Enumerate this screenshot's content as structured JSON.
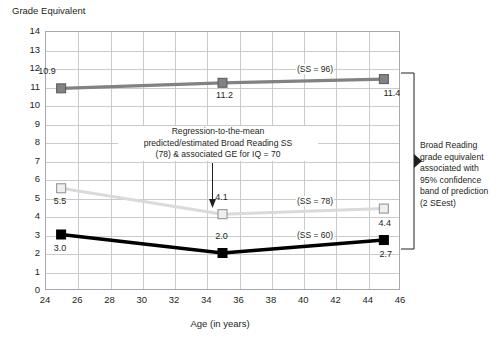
{
  "chart_data": {
    "type": "line",
    "title": "",
    "ylabel": "Grade Equivalent",
    "xlabel": "Age (in years)",
    "xlim": [
      24,
      46
    ],
    "ylim": [
      0,
      14
    ],
    "xticks": [
      24,
      26,
      28,
      30,
      32,
      34,
      36,
      38,
      40,
      42,
      44,
      46
    ],
    "yticks": [
      0,
      1,
      2,
      3,
      4,
      5,
      6,
      7,
      8,
      9,
      10,
      11,
      12,
      13,
      14
    ],
    "grid": true,
    "legend": "inline-line-labels",
    "x": [
      25,
      35,
      45
    ],
    "series": [
      {
        "name": "(SS = 96)",
        "color": "#808285",
        "marker": "filled-square",
        "values": [
          10.9,
          11.2,
          11.4
        ],
        "labels": [
          "10.9",
          "11.2",
          "11.4"
        ]
      },
      {
        "name": "(SS = 78)",
        "color": "#d9dadb",
        "marker": "open-square",
        "values": [
          5.5,
          4.1,
          4.4
        ],
        "labels": [
          "5.5",
          "4.1",
          "4.4"
        ]
      },
      {
        "name": "(SS = 60)",
        "color": "#000000",
        "marker": "filled-square",
        "values": [
          3.0,
          2.0,
          2.7
        ],
        "labels": [
          "3.0",
          "2.0",
          "2.7"
        ]
      }
    ],
    "annotations": [
      {
        "id": "center",
        "line1": "Regression-to-the-mean",
        "line2": "predicted/estimated Broad Reading SS",
        "line3": "(78) & associated GE for IQ = 70"
      },
      {
        "id": "right",
        "line1": "Broad Reading",
        "line2": "grade equivalent",
        "line3": "associated with",
        "line4": "95% confidence",
        "line5": "band of prediction",
        "line6": "(2 SEest)"
      }
    ]
  },
  "axis": {
    "y_title": "Grade Equivalent",
    "x_title": "Age (in years)"
  },
  "series_labels": {
    "ss96": "(SS = 96)",
    "ss78": "(SS = 78)",
    "ss60": "(SS = 60)"
  },
  "point_labels": {
    "ss96_p1": "10.9",
    "ss96_p2": "11.2",
    "ss96_p3": "11.4",
    "ss78_p1": "5.5",
    "ss78_p2": "4.1",
    "ss78_p3": "4.4",
    "ss60_p1": "3.0",
    "ss60_p2": "2.0",
    "ss60_p3": "2.7"
  },
  "center_annotation": {
    "line1": "Regression-to-the-mean",
    "line2": "predicted/estimated Broad Reading SS",
    "line3": "(78) & associated GE for IQ = 70"
  },
  "right_annotation": {
    "line1": "Broad Reading",
    "line2": "grade equivalent",
    "line3": "associated with",
    "line4": "95% confidence",
    "line5": "band of prediction",
    "line6": "(2 SEest)"
  },
  "colors": {
    "dark_gray": "#808285",
    "light_gray": "#d9dadb",
    "black": "#000000",
    "grid": "#c9cbcd",
    "frame": "#a7a9ac"
  }
}
